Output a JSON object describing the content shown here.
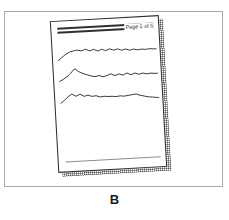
{
  "figure": {
    "caption": "B",
    "background_color": "#ffffff",
    "frame_color": "#a9a9a9"
  },
  "document": {
    "page_label": "Page 5 of 5",
    "sheet_border_color": "#2b2b2b",
    "header_rule_color": "#2f2f2f",
    "footer_rule_color": "#8c8c8c",
    "shadow_color": "#505050",
    "rotation_degrees": -3.2
  },
  "chart_data": {
    "type": "line",
    "title": "Page 5 of 5",
    "xlabel": "",
    "ylabel": "",
    "grid": false,
    "legend": "none",
    "axis_note": "three stacked unlabeled signal traces on a document page",
    "x": [
      0,
      4,
      8,
      12,
      16,
      20,
      24,
      28,
      32,
      36,
      40,
      44,
      48,
      52,
      56,
      60,
      64,
      68,
      72,
      76,
      80,
      84,
      88,
      92,
      96,
      99
    ],
    "series": [
      {
        "name": "trace-1",
        "color": "#2b2b2b",
        "values": [
          17,
          14,
          11,
          9,
          8,
          7.5,
          8.5,
          7,
          9,
          7.5,
          9.5,
          8,
          9.5,
          8,
          9.5,
          8.5,
          10,
          9,
          10.5,
          9.5,
          10.5,
          10,
          10.5,
          10,
          10.5,
          10.5
        ]
      },
      {
        "name": "trace-2",
        "color": "#2b2b2b",
        "values": [
          16,
          14,
          11.5,
          8,
          4,
          7,
          9,
          10.5,
          12,
          13,
          12,
          13.5,
          12.5,
          11,
          13,
          11.5,
          13,
          11,
          13,
          11.5,
          13,
          12,
          13,
          12.5,
          13,
          13
        ]
      },
      {
        "name": "trace-3",
        "color": "#2b2b2b",
        "values": [
          15,
          12,
          8.5,
          6,
          8.5,
          6.5,
          9,
          8,
          9.5,
          9,
          10.5,
          10,
          10.5,
          10.5,
          11,
          10.5,
          11,
          10.5,
          10,
          9.5,
          11,
          12,
          13,
          13.5,
          14,
          14.5
        ]
      }
    ],
    "ylim": [
      0,
      22
    ],
    "xlim": [
      0,
      99
    ]
  }
}
